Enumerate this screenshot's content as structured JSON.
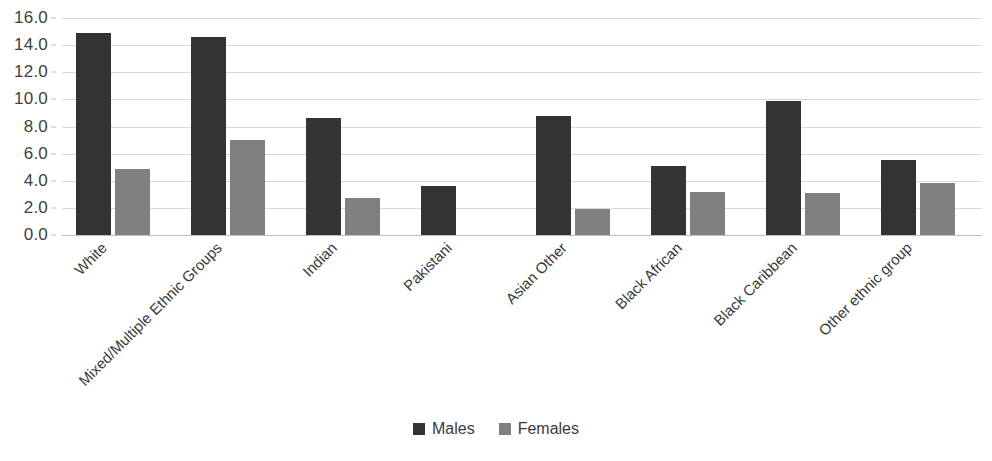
{
  "chart_data": {
    "type": "bar",
    "title": "",
    "xlabel": "",
    "ylabel": "",
    "ylim": [
      0,
      16
    ],
    "ytick_step": 2,
    "grid": true,
    "legend_position": "bottom",
    "categories": [
      "White",
      "Mixed/Multiple Ethnic Groups",
      "Indian",
      "Pakistani",
      "Asian Other",
      "Black African",
      "Black Caribbean",
      "Other ethnic group"
    ],
    "ytick_labels": [
      "16.0",
      "14.0",
      "12.0",
      "10.0",
      "8.0",
      "6.0",
      "4.0",
      "2.0",
      "0.0"
    ],
    "series": [
      {
        "name": "Males",
        "color": "#333333",
        "values": [
          14.9,
          14.6,
          8.6,
          3.6,
          8.8,
          5.1,
          9.9,
          5.5
        ]
      },
      {
        "name": "Females",
        "color": "#808080",
        "values": [
          4.9,
          7.0,
          2.7,
          0.0,
          1.9,
          3.2,
          3.1,
          3.8
        ]
      }
    ]
  },
  "legend": {
    "items": [
      {
        "label": "Males",
        "color": "#333333"
      },
      {
        "label": "Females",
        "color": "#808080"
      }
    ]
  },
  "colors": {
    "male_bar": "#333333",
    "female_bar": "#808080",
    "gridline": "#d9d9d9",
    "axis": "#bfbfbf",
    "text": "#3a3a3a",
    "background": "#ffffff"
  }
}
